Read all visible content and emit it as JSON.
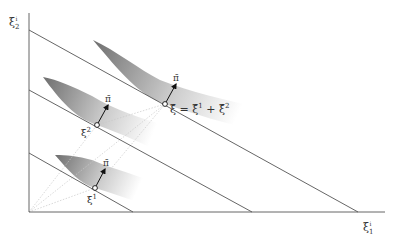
{
  "diagram": {
    "axes": {
      "y_label": "ξ",
      "y_label_sub": "2",
      "y_label_sup": "i",
      "x_label": "ξ",
      "x_label_sub": "1",
      "x_label_sup": "i"
    },
    "points": [
      {
        "id": "xi_bar",
        "label": "ξ̄ = ξ̄¹ + ξ̄²",
        "arrow_label": "π̄"
      },
      {
        "id": "xi_bar_2",
        "label": "ξ̄²",
        "arrow_label": "π̄"
      },
      {
        "id": "xi_bar_1",
        "label": "ξ̄¹",
        "arrow_label": "π̄"
      }
    ],
    "labels": {
      "sum_eq": "ξ̄ = ξ̄",
      "sum_sup1": "1",
      "sum_plus": " + ξ̄",
      "sum_sup2": "2",
      "pi_top": "π̄",
      "pi_mid": "π̄",
      "pi_bot": "π̄",
      "xi2_base": "ξ̄",
      "xi2_sup": "2",
      "xi1_base": "ξ̄",
      "xi1_sup": "1"
    },
    "colors": {
      "line": "#555555",
      "dotted": "#bbbbbb",
      "shade_dark": "#7a7a7a",
      "shade_light": "#ffffff"
    }
  }
}
